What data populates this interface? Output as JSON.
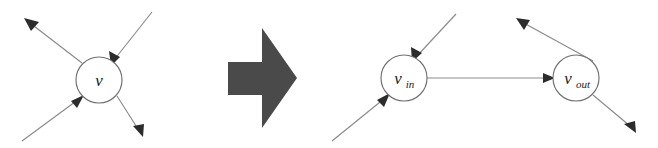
{
  "figure": {
    "background_color": "#ffffff",
    "edge_color": "#8a8a8a",
    "arrowhead_color": "#2c2c2c",
    "node_stroke_color": "#6f6f6f",
    "node_fill_color": "#ffffff",
    "label_color": "#1b1b1b",
    "block_arrow_color": "#4a4a4a"
  },
  "left_graph": {
    "name": "original-vertex",
    "node": {
      "label": "v",
      "subscript": "",
      "cx": 99,
      "cy": 80,
      "r": 23
    },
    "edges": [
      {
        "name": "incoming-from-upper-right",
        "direction": "incoming",
        "from": [
          152,
          12
        ],
        "to": [
          116,
          63
        ],
        "has_arrowhead": true
      },
      {
        "name": "incoming-from-lower-left",
        "direction": "incoming",
        "from": [
          22,
          141
        ],
        "to": [
          81,
          97
        ],
        "has_arrowhead": true
      },
      {
        "name": "outgoing-to-upper-left",
        "direction": "outgoing",
        "from": [
          82,
          63
        ],
        "to": [
          26,
          20
        ],
        "has_arrowhead": true
      },
      {
        "name": "outgoing-to-lower-right",
        "direction": "outgoing",
        "from": [
          117,
          96
        ],
        "to": [
          142,
          134
        ],
        "has_arrowhead": true
      }
    ]
  },
  "transform_arrow": {
    "name": "transformation-arrow",
    "label": "",
    "direction": "right",
    "color": "#4a4a4a",
    "bounds": {
      "x": 228,
      "y": 28,
      "width": 69,
      "height": 100
    }
  },
  "right_graph": {
    "name": "split-vertices",
    "nodes": [
      {
        "label": "v",
        "subscript": "in",
        "cx": 404,
        "cy": 78,
        "r": 23
      },
      {
        "label": "v",
        "subscript": "out",
        "cx": 576,
        "cy": 78,
        "r": 23
      }
    ],
    "edges": [
      {
        "name": "incoming-to-vin-from-upper-right",
        "direction": "incoming",
        "from": [
          456,
          14
        ],
        "to": [
          415,
          60
        ],
        "has_arrowhead": true
      },
      {
        "name": "incoming-to-vin-from-lower-left",
        "direction": "incoming",
        "from": [
          332,
          141
        ],
        "to": [
          387,
          95
        ],
        "has_arrowhead": true
      },
      {
        "name": "vin-to-vout",
        "direction": "internal",
        "from": [
          427,
          78
        ],
        "to": [
          553,
          78
        ],
        "has_arrowhead": true
      },
      {
        "name": "outgoing-from-vout-to-upper-right",
        "direction": "outgoing",
        "from": [
          593,
          61
        ],
        "to": [
          518,
          19
        ],
        "has_arrowhead": true
      },
      {
        "name": "outgoing-from-vout-to-lower-right",
        "direction": "outgoing",
        "from": [
          593,
          95
        ],
        "to": [
          634,
          131
        ],
        "has_arrowhead": true
      }
    ]
  }
}
